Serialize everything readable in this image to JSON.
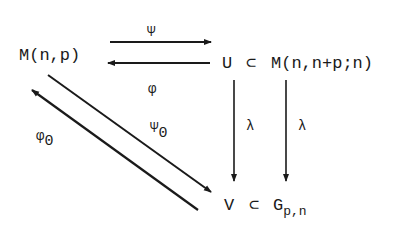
{
  "diagram": {
    "type": "commutative-diagram",
    "nodes": {
      "m_np": "M(n,p)",
      "u": "U",
      "subset_top": "⊂",
      "m_nnp": "M(n,n+p;n)",
      "v": "V",
      "subset_bottom": "⊂",
      "g_base": "G",
      "g_sub": "p,n"
    },
    "arrow_labels": {
      "psi": "Ψ",
      "phi": "φ",
      "lambda_left": "λ",
      "lambda_right": "λ",
      "psi0_base": "Ψ",
      "psi0_sub": "0",
      "phi0_base": "φ",
      "phi0_sub": "0"
    },
    "arrows": [
      {
        "from": "M(n,p)",
        "to": "U",
        "label": "Ψ"
      },
      {
        "from": "U",
        "to": "M(n,p)",
        "label": "φ"
      },
      {
        "from": "U",
        "to": "V",
        "label": "λ"
      },
      {
        "from": "M(n,n+p;n)",
        "to": "G_{p,n}",
        "label": "λ"
      },
      {
        "from": "M(n,p)",
        "to": "V",
        "label": "Ψ_0"
      },
      {
        "from": "V",
        "to": "M(n,p)",
        "label": "φ_0"
      }
    ],
    "colors": {
      "ink": "#1a1a1a",
      "background": "#ffffff"
    }
  }
}
